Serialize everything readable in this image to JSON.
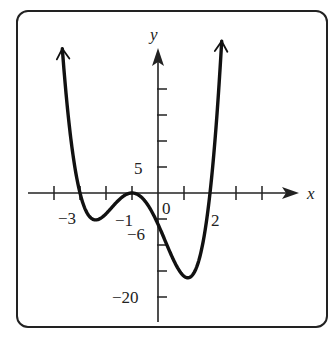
{
  "chart_data": {
    "type": "line",
    "title": "",
    "xlabel": "x",
    "ylabel": "y",
    "function": "f(x) = (x+3)(x+1)^2(x-2)",
    "xlim": [
      -5,
      5.5
    ],
    "ylim": [
      -25,
      30
    ],
    "x_ticks": [
      -4,
      -3,
      -2,
      -1,
      0,
      1,
      2,
      3,
      4
    ],
    "y_ticks": [
      -20,
      -15,
      -10,
      -5,
      5,
      10,
      15,
      20
    ],
    "tick_labels": {
      "x": [
        {
          "value": -3,
          "text": "−3"
        },
        {
          "value": -1,
          "text": "−1"
        },
        {
          "value": 0,
          "text": "0"
        },
        {
          "value": 2,
          "text": "2"
        }
      ],
      "y": [
        {
          "value": 5,
          "text": "5"
        },
        {
          "value": -6,
          "text": "−6"
        },
        {
          "value": -20,
          "text": "−20"
        }
      ]
    },
    "key_points": [
      {
        "x": -3,
        "y": 0,
        "note": "x-intercept"
      },
      {
        "x": -1,
        "y": 0,
        "note": "touches x-axis"
      },
      {
        "x": 0,
        "y": -6,
        "note": "y-intercept"
      },
      {
        "x": 2,
        "y": 0,
        "note": "x-intercept"
      },
      {
        "x": -2.2,
        "y": -4.3,
        "note": "local minimum"
      },
      {
        "x": 1.1,
        "y": -16.5,
        "note": "local minimum"
      }
    ],
    "x": [
      -3.68,
      -3.5,
      -3.25,
      -3.0,
      -2.75,
      -2.5,
      -2.25,
      -2.0,
      -1.75,
      -1.5,
      -1.25,
      -1.0,
      -0.75,
      -0.5,
      -0.25,
      0.0,
      0.25,
      0.5,
      0.75,
      1.0,
      1.25,
      1.5,
      1.75,
      2.0,
      2.25,
      2.45
    ],
    "grid": false,
    "legend": "none"
  },
  "labels": {
    "x_axis": "x",
    "y_axis": "y",
    "x_m3": "−3",
    "x_m1": "−1",
    "x_0": "0",
    "x_2": "2",
    "y_5": "5",
    "y_m6": "−6",
    "y_m20": "−20"
  },
  "colors": {
    "curve": "#111111",
    "axis": "#222222",
    "frame": "#222222"
  }
}
